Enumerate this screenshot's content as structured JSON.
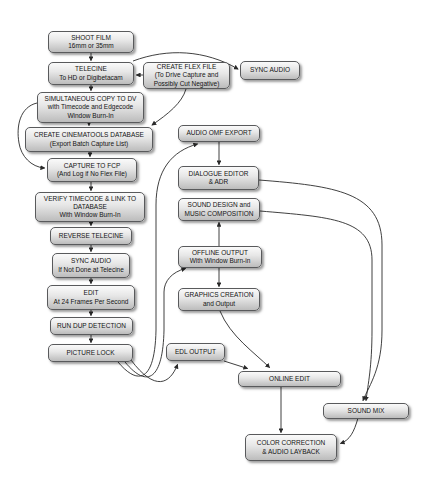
{
  "diagram": {
    "style": {
      "background": "#ffffff",
      "node_fill_top": "#fafafa",
      "node_fill_bottom": "#bcbcbc",
      "node_border": "#595a5c",
      "arrow_color": "#2a2a2a",
      "text_color": "#141414"
    },
    "nodes": [
      {
        "id": "shoot-film",
        "x": 48,
        "y": 31,
        "w": 86,
        "h": 22,
        "lines": [
          "SHOOT FILM",
          "16mm or 35mm"
        ]
      },
      {
        "id": "telecine",
        "x": 48,
        "y": 62,
        "w": 86,
        "h": 23,
        "lines": [
          "TELECINE",
          "To HD or Digibetacam"
        ]
      },
      {
        "id": "create-flex-file",
        "x": 143,
        "y": 62,
        "w": 87,
        "h": 27,
        "lines": [
          "CREATE FLEX FILE",
          "(To Drive Capture and",
          "Possibly Cut Negative)"
        ]
      },
      {
        "id": "sync-audio",
        "x": 240,
        "y": 61,
        "w": 60,
        "h": 19,
        "lines": [
          "SYNC AUDIO"
        ]
      },
      {
        "id": "simultaneous-copy-to-dv",
        "x": 37,
        "y": 92,
        "w": 107,
        "h": 31,
        "lines": [
          "SIMULTANEOUS COPY TO DV",
          "with Timecode and Edgecode",
          "Window Burn-In"
        ]
      },
      {
        "id": "create-cinematools-database",
        "x": 25,
        "y": 127,
        "w": 128,
        "h": 25,
        "lines": [
          "CREATE CINEMATOOLS DATABASE",
          "(Export Batch Capture List)"
        ]
      },
      {
        "id": "audio-omf-export",
        "x": 178,
        "y": 125,
        "w": 82,
        "h": 17,
        "lines": [
          "AUDIO OMF EXPORT"
        ]
      },
      {
        "id": "capture-to-fcp",
        "x": 47,
        "y": 158,
        "w": 90,
        "h": 24,
        "lines": [
          "CAPTURE TO FCP",
          "(And Log if No Flex File)"
        ]
      },
      {
        "id": "dialogue-editor-adr",
        "x": 178,
        "y": 166,
        "w": 81,
        "h": 24,
        "lines": [
          "DIALOGUE EDITOR",
          "& ADR"
        ]
      },
      {
        "id": "verify-timecode-link",
        "x": 35,
        "y": 192,
        "w": 110,
        "h": 30,
        "lines": [
          "VERIFY TIMECODE & LINK TO",
          "DATABASE",
          "With Window Burn-In"
        ]
      },
      {
        "id": "sound-design-music",
        "x": 178,
        "y": 198,
        "w": 82,
        "h": 23,
        "lines": [
          "SOUND DESIGN and",
          "MUSIC COMPOSITION"
        ]
      },
      {
        "id": "reverse-telecine",
        "x": 50,
        "y": 227,
        "w": 82,
        "h": 18,
        "lines": [
          "REVERSE TELECINE"
        ]
      },
      {
        "id": "offline-output",
        "x": 178,
        "y": 246,
        "w": 84,
        "h": 22,
        "lines": [
          "OFFLINE OUTPUT",
          "With Window Burn-in"
        ]
      },
      {
        "id": "sync-audio-if-not-done",
        "x": 52,
        "y": 253,
        "w": 78,
        "h": 25,
        "lines": [
          "SYNC AUDIO",
          "If Not Done at Telecine"
        ]
      },
      {
        "id": "edit-24fps",
        "x": 47,
        "y": 285,
        "w": 88,
        "h": 25,
        "lines": [
          "EDIT",
          "At 24 Frames Per Second"
        ]
      },
      {
        "id": "graphics-creation",
        "x": 178,
        "y": 288,
        "w": 82,
        "h": 23,
        "lines": [
          "GRAPHICS CREATION",
          "and Output"
        ]
      },
      {
        "id": "run-dup-detection",
        "x": 50,
        "y": 317,
        "w": 83,
        "h": 18,
        "lines": [
          "RUN DUP DETECTION"
        ]
      },
      {
        "id": "picture-lock",
        "x": 48,
        "y": 344,
        "w": 85,
        "h": 18,
        "lines": [
          "PICTURE LOCK"
        ]
      },
      {
        "id": "edl-output",
        "x": 166,
        "y": 343,
        "w": 59,
        "h": 18,
        "lines": [
          "EDL OUTPUT"
        ]
      },
      {
        "id": "online-edit",
        "x": 238,
        "y": 371,
        "w": 103,
        "h": 16,
        "lines": [
          "ONLINE EDIT"
        ]
      },
      {
        "id": "sound-mix",
        "x": 323,
        "y": 403,
        "w": 86,
        "h": 16,
        "lines": [
          "SOUND MIX"
        ]
      },
      {
        "id": "color-correction-audio-layback",
        "x": 245,
        "y": 434,
        "w": 92,
        "h": 27,
        "lines": [
          "COLOR CORRECTION",
          "& AUDIO LAYBACK"
        ]
      }
    ],
    "edges": [
      {
        "from": "shoot-film",
        "to": "telecine",
        "path": "M91 53 L91 60.5"
      },
      {
        "from": "telecine",
        "to": "simultaneous-copy-to-dv",
        "path": "M91 85 L91 90.5"
      },
      {
        "from": "simultaneous-copy-to-dv",
        "to": "create-cinematools-database",
        "path": "M89 123 L89 125.5"
      },
      {
        "from": "create-cinematools-database",
        "to": "capture-to-fcp",
        "path": "M90 152 L90 156.5"
      },
      {
        "from": "capture-to-fcp",
        "to": "verify-timecode-link",
        "path": "M91 182 L91 190.5"
      },
      {
        "from": "verify-timecode-link",
        "to": "reverse-telecine",
        "path": "M91 222 L91 225.5"
      },
      {
        "from": "reverse-telecine",
        "to": "sync-audio-if-not-done",
        "path": "M91 245 L91 251.5"
      },
      {
        "from": "sync-audio-if-not-done",
        "to": "edit-24fps",
        "path": "M91 278 L91 283.5"
      },
      {
        "from": "edit-24fps",
        "to": "run-dup-detection",
        "path": "M91 310 L91 315.5"
      },
      {
        "from": "run-dup-detection",
        "to": "picture-lock",
        "path": "M91 335 L91 342.5"
      },
      {
        "from": "create-flex-file",
        "to": "telecine",
        "path": "M143 75 L136.5 75"
      },
      {
        "from": "telecine",
        "to": "sync-audio",
        "path": "M133 61 C168 48 205 50 238 69"
      },
      {
        "from": "create-flex-file",
        "to": "create-cinematools-database",
        "path": "M186 89 C182 103 168 114 152 125"
      },
      {
        "from": "simultaneous-copy-to-dv",
        "to": "capture-to-fcp",
        "path": "M37 103 C20 107 16 126 19 143 C21 156 31 167 44.5 168"
      },
      {
        "from": "picture-lock",
        "to": "audio-omf-export",
        "path": "M118 362 C138 386 155 382 156 330 L156 205 C156 170 172 151 197.5 144"
      },
      {
        "from": "picture-lock",
        "to": "offline-output",
        "path": "M125 362 C148 390 163 378 164 330 L164 292 C164 281 172 272 185.5 268.5"
      },
      {
        "from": "picture-lock",
        "to": "edl-output",
        "path": "M131 360 C155 392 170 384 177.5 364.5"
      },
      {
        "from": "audio-omf-export",
        "to": "dialogue-editor-adr",
        "path": "M219 142 L219 164.5"
      },
      {
        "from": "offline-output",
        "to": "sound-design-music",
        "path": "M219 246 L219 222.5"
      },
      {
        "from": "offline-output",
        "to": "graphics-creation",
        "path": "M219 268 L219 286.5"
      },
      {
        "from": "edl-output",
        "to": "online-edit",
        "path": "M224 361 L247.5 368.5"
      },
      {
        "from": "graphics-creation",
        "to": "online-edit",
        "path": "M220 311 C230 336 255 353 269.5 367.5"
      },
      {
        "from": "online-edit",
        "to": "color-correction-audio-layback",
        "path": "M281 387 L281 432.5"
      },
      {
        "from": "dialogue-editor-adr",
        "to": "sound-mix",
        "path": "M259 180 C335 186 382 192 382 245 L382 330 C382 368 370 384 363 400.5"
      },
      {
        "from": "sound-design-music",
        "to": "sound-mix",
        "path": "M260 211 C330 217 372 219 372 260 L372 330 C372 367 368 384 366 400.5"
      },
      {
        "from": "sound-mix",
        "to": "color-correction-audio-layback",
        "path": "M358 418 C354 432 350 440 340.5 443.5"
      }
    ]
  }
}
